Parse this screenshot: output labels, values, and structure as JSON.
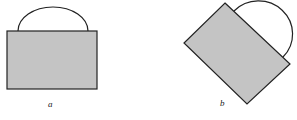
{
  "figure": {
    "panels": [
      {
        "id": "a",
        "label": "a",
        "description": "Gray rectangle with semicircular arc on top edge, upright"
      },
      {
        "id": "b",
        "label": "b",
        "description": "Same rectangle with arc, rotated about 45 degrees"
      }
    ],
    "colors": {
      "fill": "#c4c4c4",
      "stroke": "#222222",
      "background": "#ffffff"
    }
  }
}
